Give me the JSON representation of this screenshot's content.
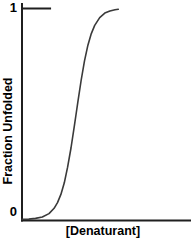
{
  "figure": {
    "background": "#ffffff",
    "axis_color": "#1f1f1f",
    "curve_color": "#3a3a3a",
    "text_color": "#000000"
  },
  "chart_data": {
    "type": "line",
    "title": "",
    "xlabel": "[Denaturant]",
    "ylabel": "Fraction Unfolded",
    "x_ticks": [],
    "y_ticks": [
      {
        "value": 0,
        "label": "0"
      },
      {
        "value": 1,
        "label": "1"
      }
    ],
    "xlim": [
      0,
      1
    ],
    "ylim": [
      0,
      1
    ],
    "grid": false,
    "legend": false,
    "series": [
      {
        "name": "fraction_unfolded",
        "points": [
          [
            0.0,
            0.001
          ],
          [
            0.04,
            0.002
          ],
          [
            0.08,
            0.005
          ],
          [
            0.12,
            0.012
          ],
          [
            0.16,
            0.028
          ],
          [
            0.19,
            0.053
          ],
          [
            0.21,
            0.08
          ],
          [
            0.23,
            0.119
          ],
          [
            0.25,
            0.174
          ],
          [
            0.27,
            0.248
          ],
          [
            0.29,
            0.339
          ],
          [
            0.31,
            0.445
          ],
          [
            0.32,
            0.5
          ],
          [
            0.33,
            0.555
          ],
          [
            0.35,
            0.661
          ],
          [
            0.37,
            0.752
          ],
          [
            0.39,
            0.826
          ],
          [
            0.41,
            0.881
          ],
          [
            0.43,
            0.92
          ],
          [
            0.46,
            0.957
          ],
          [
            0.49,
            0.978
          ],
          [
            0.52,
            0.988
          ],
          [
            0.55,
            0.994
          ],
          [
            0.57,
            0.996
          ]
        ]
      }
    ],
    "annotations": [
      {
        "type": "reference_tick",
        "y": 1,
        "x_start": 0,
        "x_end": 0.172,
        "note": "horizontal tick marking fraction unfolded = 1"
      }
    ]
  }
}
